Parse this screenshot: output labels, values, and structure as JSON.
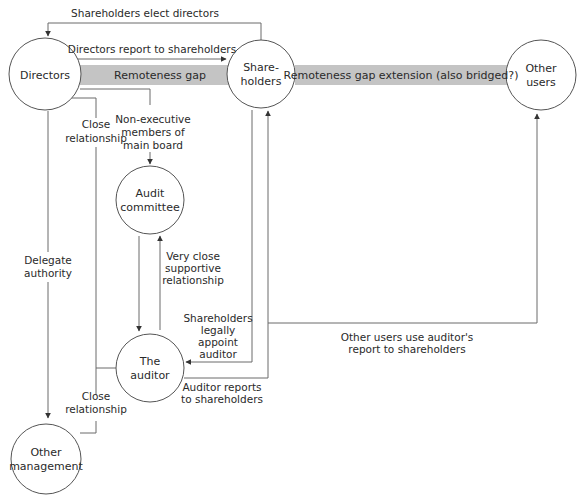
{
  "nodes": {
    "directors": {
      "lines": [
        "Directors"
      ]
    },
    "shareholders": {
      "lines": [
        "Share-",
        "holders"
      ]
    },
    "other_users": {
      "lines": [
        "Other",
        "users"
      ]
    },
    "audit_committee": {
      "lines": [
        "Audit",
        "committee"
      ]
    },
    "auditor": {
      "lines": [
        "The",
        "auditor"
      ]
    },
    "other_management": {
      "lines": [
        "Other",
        "management"
      ]
    }
  },
  "gaps": {
    "remoteness_gap": "Remoteness gap",
    "remoteness_gap_extension": "Remoteness gap extension (also bridged?)"
  },
  "edges": {
    "shareholders_elect_directors": [
      "Shareholders elect directors"
    ],
    "directors_report": [
      "Directors report to shareholders"
    ],
    "close_relationship_top": [
      "Close",
      "relationship"
    ],
    "non_executive": [
      "Non-executive",
      "members of",
      "main board"
    ],
    "delegate_authority": [
      "Delegate",
      "authority"
    ],
    "very_close": [
      "Very close",
      "supportive",
      "relationship"
    ],
    "legally_appoint": [
      "Shareholders",
      "legally",
      "appoint",
      "auditor"
    ],
    "auditor_reports": [
      "Auditor reports",
      "to shareholders"
    ],
    "close_relationship_bottom": [
      "Close",
      "relationship"
    ],
    "other_users_use": [
      "Other users use auditor's",
      "report to shareholders"
    ]
  },
  "colors": {
    "gap_band": "#c4c4c4",
    "line": "#6a6a6a",
    "circle_stroke": "#555555",
    "text": "#2a2a2a"
  }
}
